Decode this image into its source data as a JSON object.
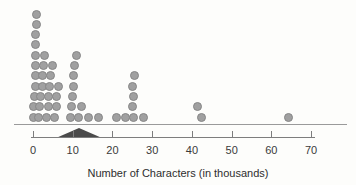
{
  "chart_data": {
    "type": "dotplot",
    "title": "",
    "xlabel": "Number of Characters (in thousands)",
    "ylabel": "",
    "xlim": [
      -3,
      78
    ],
    "x_ticks": [
      0,
      10,
      20,
      30,
      40,
      50,
      60,
      70
    ],
    "grid": false,
    "dot_color": "#a0a0a0",
    "mean_marker": {
      "shape": "filled-triangle",
      "color": "#4a4a4a",
      "value": 11.6
    },
    "values": [
      0.06,
      0.18,
      0.45,
      0.56,
      0.63,
      0.66,
      0.71,
      0.71,
      0.72,
      0.81,
      0.96,
      1.5,
      1.7,
      2.0,
      2.3,
      2.45,
      2.6,
      2.9,
      3.5,
      3.8,
      4.0,
      4.2,
      4.5,
      4.8,
      5.3,
      5.8,
      6.0,
      6.3,
      9.4,
      9.8,
      10.0,
      10.2,
      10.3,
      10.5,
      10.9,
      11.5,
      12.3,
      13.9,
      16.4,
      21.0,
      23.2,
      25.0,
      25.1,
      25.2,
      25.3,
      25.6,
      27.7,
      41.4,
      42.4,
      64.2
    ],
    "dots": [
      {
        "v": 0.06,
        "s": 0
      },
      {
        "v": 0.18,
        "s": 1
      },
      {
        "v": 0.45,
        "s": 2
      },
      {
        "v": 0.56,
        "s": 3
      },
      {
        "v": 0.63,
        "s": 4
      },
      {
        "v": 0.66,
        "s": 5
      },
      {
        "v": 0.71,
        "s": 6
      },
      {
        "v": 0.71,
        "s": 7
      },
      {
        "v": 0.72,
        "s": 8
      },
      {
        "v": 0.81,
        "s": 9
      },
      {
        "v": 0.96,
        "s": 10
      },
      {
        "v": 1.5,
        "s": 0
      },
      {
        "v": 1.7,
        "s": 1
      },
      {
        "v": 2.0,
        "s": 2
      },
      {
        "v": 2.3,
        "s": 3
      },
      {
        "v": 2.45,
        "s": 4
      },
      {
        "v": 2.6,
        "s": 5
      },
      {
        "v": 2.9,
        "s": 6
      },
      {
        "v": 3.5,
        "s": 0
      },
      {
        "v": 3.8,
        "s": 1
      },
      {
        "v": 4.0,
        "s": 2
      },
      {
        "v": 4.2,
        "s": 3
      },
      {
        "v": 4.5,
        "s": 4
      },
      {
        "v": 4.8,
        "s": 5
      },
      {
        "v": 5.3,
        "s": 0
      },
      {
        "v": 5.8,
        "s": 1
      },
      {
        "v": 6.0,
        "s": 2
      },
      {
        "v": 6.3,
        "s": 3
      },
      {
        "v": 9.4,
        "s": 0
      },
      {
        "v": 9.8,
        "s": 1
      },
      {
        "v": 10.0,
        "s": 2
      },
      {
        "v": 10.2,
        "s": 3
      },
      {
        "v": 10.3,
        "s": 4
      },
      {
        "v": 10.5,
        "s": 5
      },
      {
        "v": 10.9,
        "s": 6
      },
      {
        "v": 11.5,
        "s": 0
      },
      {
        "v": 12.3,
        "s": 1
      },
      {
        "v": 13.9,
        "s": 0
      },
      {
        "v": 16.4,
        "s": 0
      },
      {
        "v": 21.0,
        "s": 0
      },
      {
        "v": 23.2,
        "s": 0
      },
      {
        "v": 25.2,
        "s": 0
      },
      {
        "v": 25.0,
        "s": 1
      },
      {
        "v": 25.3,
        "s": 2
      },
      {
        "v": 25.1,
        "s": 3
      },
      {
        "v": 25.6,
        "s": 4
      },
      {
        "v": 27.7,
        "s": 0
      },
      {
        "v": 41.4,
        "s": 1
      },
      {
        "v": 42.4,
        "s": 0
      },
      {
        "v": 64.2,
        "s": 0
      }
    ]
  }
}
